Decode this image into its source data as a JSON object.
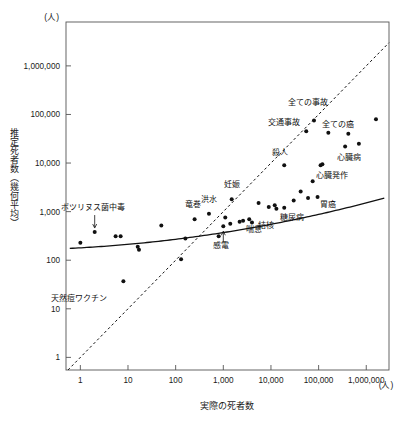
{
  "chart_data": {
    "type": "scatter",
    "title": "",
    "xlabel": "実際の死者数",
    "ylabel": "推定死者数（幾何平均）",
    "x_unit": "(人)",
    "y_unit": "(人)",
    "x_scale": "log",
    "y_scale": "log",
    "xlim": [
      0.5,
      3000000
    ],
    "ylim": [
      0.55,
      8000000
    ],
    "x_ticks": [
      "1",
      "10",
      "100",
      "1,000",
      "10,000",
      "100,000",
      "1,000,000"
    ],
    "x_tick_values": [
      1,
      10,
      100,
      1000,
      10000,
      100000,
      1000000
    ],
    "y_ticks": [
      "1",
      "10",
      "100",
      "1,000",
      "10,000",
      "100,000",
      "1,000,000"
    ],
    "y_tick_values": [
      1,
      10,
      100,
      1000,
      10000,
      100000,
      1000000
    ],
    "grid": false,
    "legend": "none",
    "reference_line": {
      "name": "identity-line",
      "style": "dashed",
      "description": "y = x 対角線"
    },
    "fit_curve": {
      "name": "fitted-curve",
      "style": "solid",
      "description": "推定値の当てはめ曲線"
    },
    "points": [
      {
        "label": "天然痘ワクチン",
        "x": 8,
        "y": 37,
        "label_dx": -44,
        "label_dy": 20
      },
      {
        "label": "ボツリヌス菌中毒",
        "x": 2,
        "y": 380,
        "label_dx": -2,
        "label_dy": -22
      },
      {
        "label": "竜巻",
        "x": 250,
        "y": 700,
        "label_dx": -2,
        "label_dy": -12
      },
      {
        "label": "洪水",
        "x": 500,
        "y": 900,
        "label_dx": 0,
        "label_dy": -12
      },
      {
        "label": "妊娠",
        "x": 1500,
        "y": 1800,
        "label_dx": 0,
        "label_dy": -12
      },
      {
        "label": "感電",
        "x": 1000,
        "y": 500,
        "label_dx": -2,
        "label_dy": 22
      },
      {
        "label": "喘息",
        "x": 2200,
        "y": 620,
        "label_dx": 14,
        "label_dy": 10
      },
      {
        "label": "結核",
        "x": 4000,
        "y": 600,
        "label_dx": 14,
        "label_dy": 6
      },
      {
        "label": "糖尿病",
        "x": 19000,
        "y": 1200,
        "label_dx": 8,
        "label_dy": 12
      },
      {
        "label": "胃癌",
        "x": 95000,
        "y": 2000,
        "label_dx": 10,
        "label_dy": 10
      },
      {
        "label": "殺人",
        "x": 19000,
        "y": 9000,
        "label_dx": -4,
        "label_dy": -10
      },
      {
        "label": "心臓発作",
        "x": 120000,
        "y": 9500,
        "label_dx": 10,
        "label_dy": 14
      },
      {
        "label": "心臓病",
        "x": 360000,
        "y": 22000,
        "label_dx": 4,
        "label_dy": 14
      },
      {
        "label": "交通事故",
        "x": 55000,
        "y": 45000,
        "label_dx": -22,
        "label_dy": -6
      },
      {
        "label": "全ての事故",
        "x": 80000,
        "y": 75000,
        "label_dx": -6,
        "label_dy": -16
      },
      {
        "label": "全ての癌",
        "x": 160000,
        "y": 42000,
        "label_dx": 10,
        "label_dy": -6
      }
    ],
    "unlabeled_points": [
      {
        "x": 1,
        "y": 230
      },
      {
        "x": 5.5,
        "y": 310
      },
      {
        "x": 7,
        "y": 310
      },
      {
        "x": 16,
        "y": 190
      },
      {
        "x": 17,
        "y": 165
      },
      {
        "x": 50,
        "y": 520
      },
      {
        "x": 130,
        "y": 105
      },
      {
        "x": 160,
        "y": 280
      },
      {
        "x": 800,
        "y": 310
      },
      {
        "x": 1100,
        "y": 760
      },
      {
        "x": 1400,
        "y": 560
      },
      {
        "x": 2600,
        "y": 650
      },
      {
        "x": 3500,
        "y": 700
      },
      {
        "x": 5500,
        "y": 1500
      },
      {
        "x": 9000,
        "y": 1250
      },
      {
        "x": 12000,
        "y": 1350
      },
      {
        "x": 13000,
        "y": 1150
      },
      {
        "x": 30000,
        "y": 1700
      },
      {
        "x": 42000,
        "y": 2600
      },
      {
        "x": 60000,
        "y": 1900
      },
      {
        "x": 75000,
        "y": 4200
      },
      {
        "x": 110000,
        "y": 9000
      },
      {
        "x": 420000,
        "y": 40000
      },
      {
        "x": 700000,
        "y": 25000
      },
      {
        "x": 1600000,
        "y": 80000
      }
    ]
  }
}
